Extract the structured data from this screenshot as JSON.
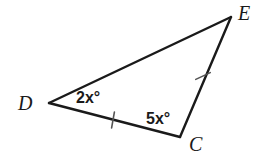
{
  "figure": {
    "background_color": "#ffffff",
    "stroke_color": "#1a1a1a",
    "vertices": [
      {
        "name": "D",
        "label": "D",
        "x": 49,
        "y": 103,
        "label_x": 18,
        "label_y": 110
      },
      {
        "name": "E",
        "label": "E",
        "x": 231,
        "y": 17,
        "label_x": 238,
        "label_y": 20
      },
      {
        "name": "C",
        "label": "C",
        "x": 180,
        "y": 137,
        "label_x": 189,
        "label_y": 151
      }
    ],
    "sides": [
      {
        "name": "side-DE",
        "from": "D",
        "to": "E",
        "ticks": 0
      },
      {
        "name": "side-DC",
        "from": "D",
        "to": "C",
        "ticks": 1
      },
      {
        "name": "side-CE",
        "from": "C",
        "to": "E",
        "ticks": 1
      }
    ],
    "angles": [
      {
        "name": "angle-D",
        "at_vertex": "D",
        "coefficient": "2",
        "variable": "x",
        "unit": "°",
        "text": "2x°",
        "label_x": 76,
        "label_y": 103
      },
      {
        "name": "angle-C",
        "at_vertex": "C",
        "coefficient": "5",
        "variable": "x",
        "unit": "°",
        "text": "5x°",
        "label_x": 146,
        "label_y": 124
      }
    ],
    "tick_marks": [
      {
        "name": "tick-side-DC",
        "x": 113,
        "y": 120,
        "angle_deg": 100
      },
      {
        "name": "tick-side-CE",
        "x": 203,
        "y": 76,
        "angle_deg": 155
      }
    ]
  }
}
